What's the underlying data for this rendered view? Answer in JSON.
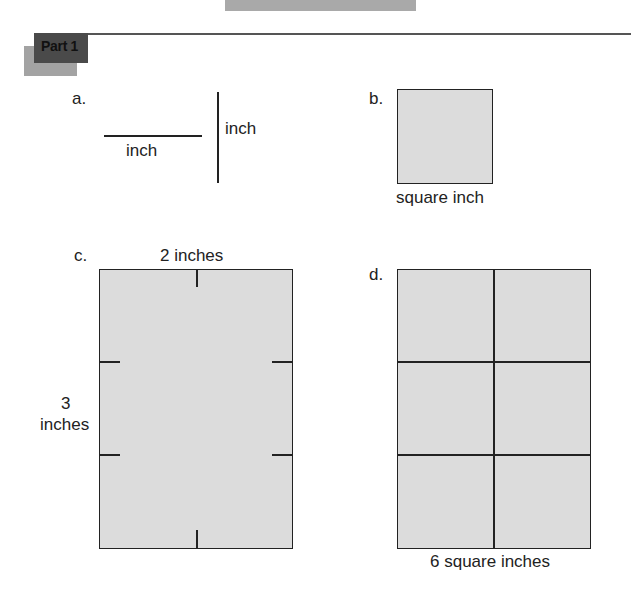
{
  "header": {
    "part_label": "Part 1"
  },
  "items": {
    "a": {
      "letter": "a.",
      "horizontal_label": "inch",
      "vertical_label": "inch"
    },
    "b": {
      "letter": "b.",
      "caption": "square inch"
    },
    "c": {
      "letter": "c.",
      "width_label": "2 inches",
      "height_label_number": "3",
      "height_label_unit": "inches"
    },
    "d": {
      "letter": "d.",
      "caption": "6 square inches",
      "rows": 3,
      "cols": 2
    }
  },
  "colors": {
    "fill": "#dcdcdc",
    "stroke": "#222222",
    "badge": "#4a4a4a",
    "badge_shadow": "#a3a3a3"
  }
}
